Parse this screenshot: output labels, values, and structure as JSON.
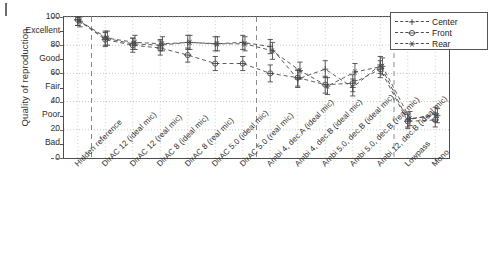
{
  "chart_data": {
    "type": "line",
    "title": "",
    "xlabel": "",
    "ylabel": "Quality of reproduction",
    "ylim": [
      0,
      100
    ],
    "grid": true,
    "legend_position": "top-right",
    "ytick_values": [
      0,
      20,
      40,
      60,
      80,
      100
    ],
    "ytick_labels": [
      "0",
      "20",
      "40",
      "60",
      "80",
      "100"
    ],
    "yverbal_labels": [
      "Bad",
      "Poor",
      "Fair",
      "Good",
      "Excellent"
    ],
    "yverbal_values": [
      10,
      30,
      50,
      70,
      90
    ],
    "categories": [
      "Hidden reference",
      "DirAC 12 (ideal mic)",
      "DirAC 12 (real mic)",
      "DirAC 8 (ideal mic)",
      "DirAC 8 (real mic)",
      "DirAC 5.0 (ideal mic)",
      "DirAC 5.0 (real mic)",
      "Ambi 4, dec.A (ideal mic)",
      "Ambi 4, dec.B (ideal mic)",
      "Ambi 5.0, dec.B (ideal mic)",
      "Ambi 5.0, dec.B (real mic)",
      "Ambi 12, dec.B (ideal mic)",
      "Lowpass",
      "Mono"
    ],
    "separators_after": [
      "Hidden reference",
      "DirAC 5.0 (real mic)",
      "Ambi 12, dec.B (ideal mic)"
    ],
    "series": [
      {
        "name": "Center",
        "marker": "plus",
        "values": [
          98,
          85,
          81,
          80,
          82,
          81,
          82,
          79,
          56,
          63,
          50,
          66,
          27,
          31
        ],
        "err_low": [
          4,
          5,
          4,
          4,
          5,
          5,
          5,
          5,
          6,
          6,
          6,
          6,
          5,
          5
        ],
        "err_high": [
          2,
          5,
          4,
          4,
          5,
          5,
          5,
          5,
          6,
          6,
          6,
          6,
          5,
          5
        ]
      },
      {
        "name": "Front",
        "marker": "circle-dash",
        "values": [
          98,
          84,
          80,
          78,
          73,
          67,
          67,
          60,
          57,
          52,
          53,
          63,
          26,
          27
        ],
        "err_low": [
          4,
          5,
          5,
          5,
          5,
          5,
          5,
          6,
          6,
          6,
          6,
          6,
          5,
          5
        ],
        "err_high": [
          2,
          5,
          5,
          5,
          5,
          5,
          5,
          6,
          6,
          6,
          6,
          6,
          5,
          5
        ]
      },
      {
        "name": "Rear",
        "marker": "asterisk",
        "values": [
          97,
          85,
          82,
          81,
          82,
          81,
          81,
          76,
          62,
          51,
          61,
          65,
          28,
          30
        ],
        "err_low": [
          4,
          5,
          5,
          5,
          5,
          5,
          5,
          6,
          6,
          6,
          6,
          6,
          5,
          5
        ],
        "err_high": [
          3,
          5,
          5,
          5,
          5,
          5,
          5,
          6,
          6,
          6,
          6,
          6,
          5,
          5
        ]
      }
    ]
  },
  "legend": {
    "items": [
      {
        "label": "Center"
      },
      {
        "label": "Front"
      },
      {
        "label": "Rear"
      }
    ]
  },
  "axis": {
    "y_title": "Quality of reproduction"
  },
  "colors": {
    "line": "#4a4a4a",
    "grid": "#b9b9b9",
    "separator": "#8a8a8a",
    "axis": "#4d4d4d",
    "text": "#2b2b2b"
  }
}
